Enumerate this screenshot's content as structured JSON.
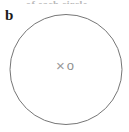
{
  "figure": {
    "panel_label": "b",
    "cropped_caption": "of each circle",
    "background_color": "#ffffff"
  },
  "circle": {
    "name": "large-outline-circle",
    "stroke_color": "#767676",
    "fill": "none",
    "stroke_width": 1,
    "center_x": 66,
    "center_y": 69.5,
    "radius_x": 56,
    "radius_y": 55
  },
  "center_markers": {
    "cross_symbol": "×",
    "ring_symbol": "o",
    "cross_color": "#9a9a9a",
    "ring_color": "#8f8f8f"
  }
}
